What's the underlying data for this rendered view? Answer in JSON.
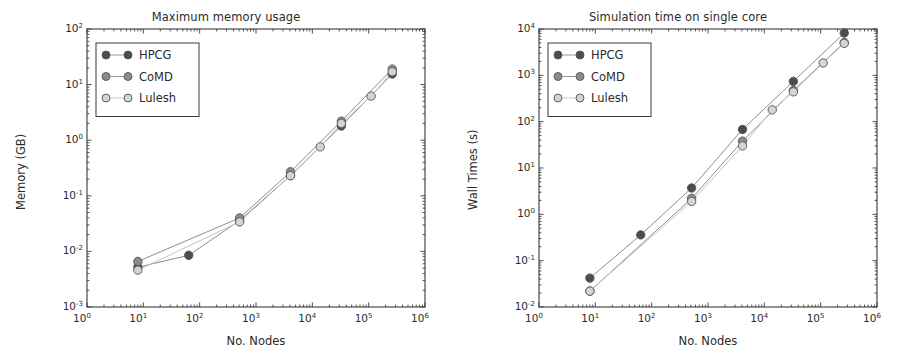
{
  "figure": {
    "width": 904,
    "height": 356,
    "background": "#ffffff",
    "panel_count": 2
  },
  "common": {
    "xlabel": "No. Nodes",
    "x_tick_labels": [
      "10⁰",
      "10¹",
      "10²",
      "10³",
      "10⁴",
      "10⁵",
      "10⁶"
    ],
    "x_tick_mantissa": "10",
    "x_tick_exponents": [
      "0",
      "1",
      "2",
      "3",
      "4",
      "5",
      "6"
    ],
    "legend_entries": [
      "HPCG",
      "CoMD",
      "Lulesh"
    ],
    "series_colors": {
      "HPCG": "#4d4d4d",
      "CoMD": "#8c8c8c",
      "Lulesh": "#d4d4d4"
    },
    "line_color": "#9a9a9a",
    "marker_edge_color": "#555555",
    "axis_color": "#3a3a3a"
  },
  "chart_data": [
    {
      "id": "maximum-memory-usage",
      "type": "line",
      "title": "Maximum memory usage",
      "xlabel": "No. Nodes",
      "ylabel": "Memory (GB)",
      "xscale": "log",
      "yscale": "log",
      "xlim": [
        1,
        1000000
      ],
      "ylim": [
        0.001,
        100
      ],
      "xtick_labels": [
        "10⁰",
        "10¹",
        "10²",
        "10³",
        "10⁴",
        "10⁵",
        "10⁶"
      ],
      "ytick_labels": [
        "10⁻³",
        "10⁻²",
        "10⁻¹",
        "10⁰",
        "10¹",
        "10²"
      ],
      "ytick_exponents": [
        "-3",
        "-2",
        "-1",
        "0",
        "1",
        "2"
      ],
      "grid": false,
      "legend_position": "upper left",
      "series": [
        {
          "name": "HPCG",
          "color": "#4d4d4d",
          "x": [
            8,
            64,
            512,
            4096,
            32768,
            262144
          ],
          "y": [
            0.0052,
            0.0085,
            0.036,
            0.23,
            1.8,
            15.5
          ]
        },
        {
          "name": "CoMD",
          "color": "#8c8c8c",
          "x": [
            8,
            512,
            4096,
            32768,
            262144
          ],
          "y": [
            0.0066,
            0.04,
            0.27,
            2.2,
            19.0
          ]
        },
        {
          "name": "Lulesh",
          "color": "#d4d4d4",
          "x": [
            8,
            512,
            4096,
            13824,
            32768,
            110592,
            262144
          ],
          "y": [
            0.0046,
            0.034,
            0.23,
            0.76,
            2.0,
            6.2,
            17.0
          ]
        }
      ]
    },
    {
      "id": "simulation-time-single-core",
      "type": "line",
      "title": "Simulation time on single core",
      "xlabel": "No. Nodes",
      "ylabel": "Wall Times (s)",
      "xscale": "log",
      "yscale": "log",
      "xlim": [
        1,
        1000000
      ],
      "ylim": [
        0.01,
        10000
      ],
      "xtick_labels": [
        "10⁰",
        "10¹",
        "10²",
        "10³",
        "10⁴",
        "10⁵",
        "10⁶"
      ],
      "ytick_labels": [
        "10⁻²",
        "10⁻¹",
        "10⁰",
        "10¹",
        "10²",
        "10³",
        "10⁴"
      ],
      "ytick_exponents": [
        "-2",
        "-1",
        "0",
        "1",
        "2",
        "3",
        "4"
      ],
      "grid": false,
      "legend_position": "upper left",
      "series": [
        {
          "name": "HPCG",
          "color": "#4d4d4d",
          "x": [
            8,
            64,
            512,
            4096,
            32768,
            262144
          ],
          "y": [
            0.042,
            0.36,
            3.7,
            68,
            740,
            8200
          ]
        },
        {
          "name": "CoMD",
          "color": "#8c8c8c",
          "x": [
            8,
            512,
            4096,
            32768,
            262144
          ],
          "y": [
            0.022,
            2.2,
            38,
            470,
            5100
          ]
        },
        {
          "name": "Lulesh",
          "color": "#d4d4d4",
          "x": [
            8,
            512,
            4096,
            13824,
            32768,
            110592,
            262144
          ],
          "y": [
            0.022,
            1.9,
            30,
            180,
            440,
            1850,
            4900
          ]
        }
      ]
    }
  ]
}
